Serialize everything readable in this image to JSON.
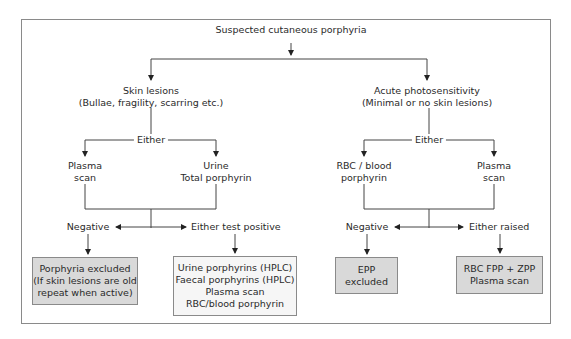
{
  "diagram": {
    "title": "Suspected cutaneous porphyria",
    "left_branch": {
      "heading": "Skin lesions",
      "subheading": "(Bullae, fragility, scarring etc.)",
      "either": "Either",
      "options": [
        {
          "line1": "Plasma",
          "line2": "scan"
        },
        {
          "line1": "Urine",
          "line2": "Total porphyrin"
        }
      ],
      "negative": "Negative",
      "positive": "Either test positive",
      "negative_box": [
        "Porphyria excluded",
        "(If skin lesions are old",
        "repeat when active)"
      ],
      "positive_box": [
        "Urine porphyrins (HPLC)",
        "Faecal porphyrins (HPLC)",
        "Plasma scan",
        "RBC/blood porphyrin"
      ]
    },
    "right_branch": {
      "heading": "Acute photosensitivity",
      "subheading": "(Minimal or no skin lesions)",
      "either": "Either",
      "options": [
        {
          "line1": "RBC / blood",
          "line2": "porphyrin"
        },
        {
          "line1": "Plasma",
          "line2": "scan"
        }
      ],
      "negative": "Negative",
      "positive": "Either raised",
      "negative_box": [
        "EPP",
        "excluded"
      ],
      "positive_box": [
        "RBC FPP + ZPP",
        "Plasma scan"
      ]
    },
    "colors": {
      "line": "#333333",
      "frame": "#8a8a8a",
      "gray_box": "#d9d9d9",
      "light_box": "#f6f6f6"
    }
  }
}
